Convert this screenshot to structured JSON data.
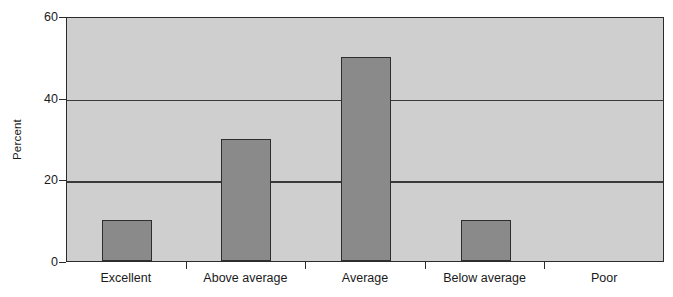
{
  "chart_data": {
    "type": "bar",
    "title": "",
    "xlabel": "",
    "ylabel": "Percent",
    "categories": [
      "Excellent",
      "Above average",
      "Average",
      "Below average",
      "Poor"
    ],
    "values": [
      10,
      30,
      50,
      10,
      0
    ],
    "ylim": [
      0,
      60
    ],
    "yticks": [
      0,
      20,
      40,
      60
    ],
    "ytick_labels": [
      "0",
      "20",
      "40",
      "60"
    ],
    "gridlines": [
      20,
      40
    ],
    "grid": true,
    "legend": "none",
    "colors": {
      "bar_fill": "#8a8a8a",
      "bar_border": "#2e2e2e",
      "plot_background": "#cfcfcf",
      "axis": "#2b2b2b",
      "gridline": "#3a3a3a",
      "page_background": "#ffffff",
      "text": "#1a1a1a"
    }
  }
}
